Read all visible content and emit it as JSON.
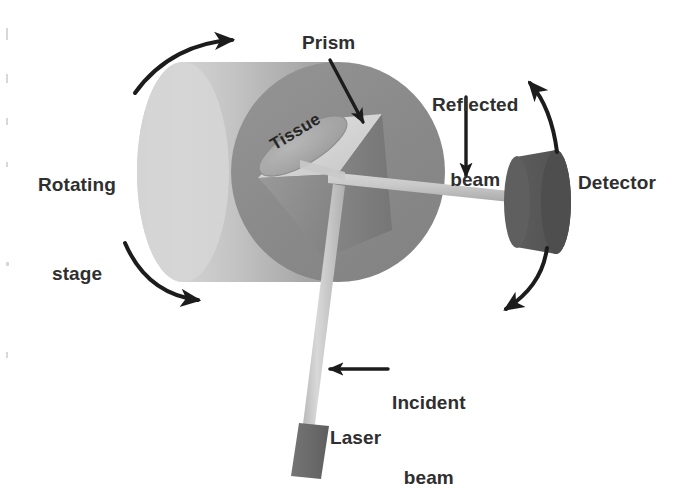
{
  "figure": {
    "background_color": "#ffffff",
    "width": 683,
    "height": 479
  },
  "labels": {
    "rotating_stage_line1": "Rotating",
    "rotating_stage_line2": "stage",
    "prism": "Prism",
    "tissue": "Tissue",
    "reflected_line1": "Reflected",
    "reflected_line2": "beam",
    "detector": "Detector",
    "incident_line1": "Incident",
    "incident_line2": "beam",
    "laser": "Laser"
  },
  "colors": {
    "text": "#2f2f2f",
    "arrow": "#1c1c1c",
    "cylinder_body_light": "#d2d2d2",
    "cylinder_body_mid": "#b4b4b4",
    "cylinder_body_shadow": "#9a9a9a",
    "cylinder_face": "#8c8c8c",
    "prism_top_face": "#d8d8d8",
    "prism_left_face": "#8f8f8f",
    "prism_right_face": "#7e7e7e",
    "tissue_ellipse": "#a6a6a6",
    "beam": "#cfcfcf",
    "beam_shade": "#b0b0b0",
    "detector_body": "#555555",
    "detector_face": "#4a4a4a",
    "laser_body": "#6b6b6b"
  },
  "components": [
    {
      "name": "rotating-stage",
      "type": "cylinder",
      "description": "Large light gray cylinder seen at an angle, rotates about its axis"
    },
    {
      "name": "prism",
      "type": "triangular-prism",
      "description": "Reflective prism mounted on the front face of the rotating stage"
    },
    {
      "name": "tissue",
      "type": "sample",
      "description": "Tissue sample ellipse resting on the upper facet of the prism"
    },
    {
      "name": "laser",
      "type": "source",
      "description": "Laser source emitting the incident beam"
    },
    {
      "name": "incident-beam",
      "type": "beam",
      "description": "Beam travelling from the laser up to the prism"
    },
    {
      "name": "reflected-beam",
      "type": "beam",
      "description": "Beam leaving the prism toward the detector"
    },
    {
      "name": "detector",
      "type": "detector",
      "description": "Dark cylindrical detector that swings on an arc"
    }
  ],
  "annotations": [
    {
      "name": "stage-rotation-arrow-top",
      "kind": "curved-arrow",
      "meaning": "stage rotation direction (upper)"
    },
    {
      "name": "stage-rotation-arrow-bottom",
      "kind": "curved-arrow",
      "meaning": "stage rotation direction (lower)"
    },
    {
      "name": "detector-arc-arrow-up",
      "kind": "curved-arrow",
      "meaning": "detector swings upward along arc"
    },
    {
      "name": "detector-arc-arrow-down",
      "kind": "curved-arrow",
      "meaning": "detector swings downward along arc"
    },
    {
      "name": "prism-pointer-arrow",
      "kind": "straight-arrow",
      "meaning": "points from Prism label to prism"
    },
    {
      "name": "reflected-pointer-arrow",
      "kind": "straight-arrow",
      "meaning": "points from Reflected beam label to the reflected beam"
    },
    {
      "name": "incident-pointer-arrow",
      "kind": "straight-arrow",
      "meaning": "points from Incident beam label to the incident beam"
    }
  ]
}
